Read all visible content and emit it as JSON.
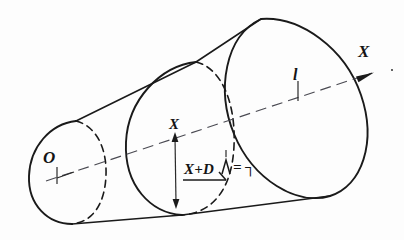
{
  "figure": {
    "kind": "hand-drawn engineering sketch",
    "background_color": "#fdfdfd",
    "ink_color": "#1a1a1a",
    "centerline_color": "#4a4a52"
  },
  "labels": {
    "origin": "O",
    "axis": "X",
    "length": "l",
    "radius": "X",
    "formula": "X+D",
    "formula_symbol": "Λ",
    "formula_equals": "=",
    "formula_result": "┐"
  },
  "annotations": {
    "origin_note": "origin tick at small-end face on axis",
    "length_note": "tick mark on axis at station l",
    "radius_note": "double-headed dimension arrow from axis to section edge",
    "axis_note": "axis arrow pointing up-right, labelled X"
  },
  "geometry": {
    "small_ellipse": {
      "cx": 68,
      "cy": 172,
      "rx": 38,
      "ry": 52,
      "rotation_deg": -18
    },
    "mid_ellipse": {
      "cx": 177,
      "cy": 140,
      "rx": 58,
      "ry": 80,
      "rotation_deg": -18
    },
    "large_ellipse": {
      "cx": 297,
      "cy": 104,
      "rx": 68,
      "ry": 92,
      "rotation_deg": -18
    },
    "axis_start": {
      "x": 46,
      "y": 180
    },
    "axis_end": {
      "x": 386,
      "y": 68
    },
    "axis_arrow_tip": {
      "x": 386,
      "y": 68
    }
  }
}
